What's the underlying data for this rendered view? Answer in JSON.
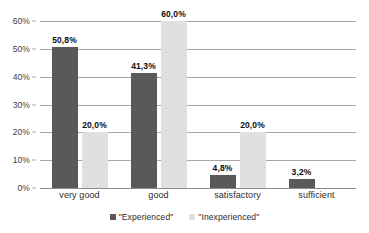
{
  "chart_data": {
    "type": "bar",
    "title": "",
    "xlabel": "",
    "ylabel": "",
    "categories": [
      "very good",
      "good",
      "satisfactory",
      "sufficient"
    ],
    "ylim": [
      0,
      60
    ],
    "ytick_values": [
      0,
      10,
      20,
      30,
      40,
      50,
      60
    ],
    "ytick_labels": [
      "0%",
      "10%",
      "20%",
      "30%",
      "40%",
      "50%",
      "60%"
    ],
    "grid": true,
    "legend_position": "bottom-center",
    "series": [
      {
        "name": "\"Experienced\"",
        "color": "#595959",
        "values": [
          50.8,
          41.3,
          4.8,
          3.2
        ],
        "data_labels": [
          "50,8%",
          "41,3%",
          "4,8%",
          "3,2%"
        ]
      },
      {
        "name": "\"Inexperienced\"",
        "color": "#e0e0e0",
        "values": [
          20.0,
          60.0,
          20.0,
          null
        ],
        "data_labels": [
          "20,0%",
          "60,0%",
          "20,0%",
          ""
        ]
      }
    ]
  },
  "colors": {
    "experienced": "#595959",
    "inexperienced": "#e0e0e0",
    "gridline": "#a6a6a6",
    "axis": "#8c8c8c",
    "background": "#ffffff",
    "text": "#2b2b2b"
  }
}
